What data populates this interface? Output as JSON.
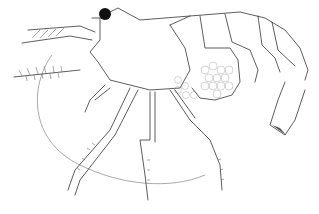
{
  "image": {
    "subject": "shrimp line drawing",
    "background": "#ffffff",
    "stroke_color": "#333333",
    "eye_color": "#111111"
  }
}
